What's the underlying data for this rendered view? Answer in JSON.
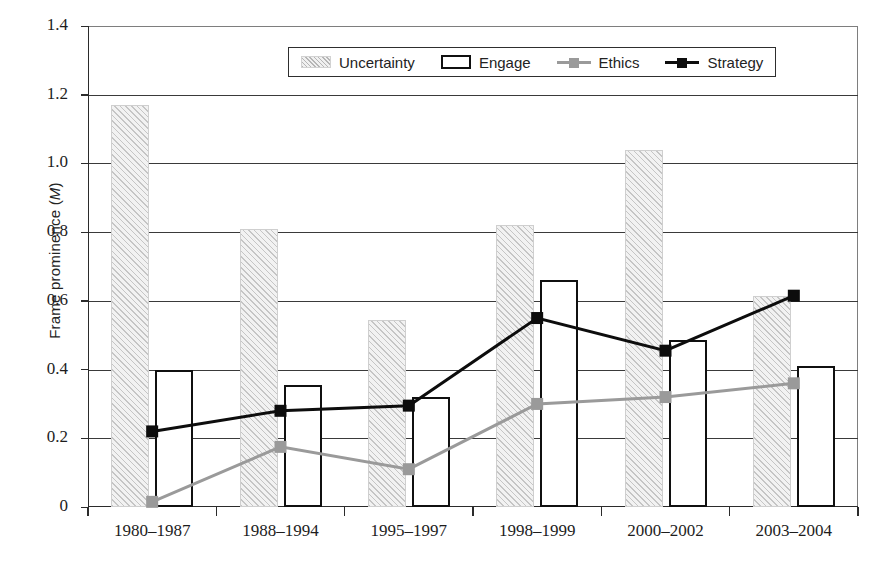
{
  "chart_data": {
    "type": "bar",
    "title": "",
    "subtitle": "",
    "xlabel": "",
    "ylabel": "Frame prominence (M)",
    "ylabel_plain": "Frame prominence (",
    "ylabel_italic": "M",
    "ylabel_tail": ")",
    "categories": [
      "1980–1987",
      "1988–1994",
      "1995–1997",
      "1998–1999",
      "2000–2002",
      "2003–2004"
    ],
    "ylim": [
      0,
      1.4
    ],
    "ytick_labels": [
      "0",
      "0.2",
      "0.4",
      "0.6",
      "0.8",
      "1.0",
      "1.2",
      "1.4"
    ],
    "ytick_values": [
      0,
      0.2,
      0.4,
      0.6,
      0.8,
      1.0,
      1.2,
      1.4
    ],
    "grid": true,
    "grid_axis": "y",
    "legend_position": "top-center",
    "series": [
      {
        "name": "Uncertainty",
        "render": "bar",
        "style": "hatched-gray",
        "color": "#f2f2f2",
        "values": [
          1.17,
          0.81,
          0.545,
          0.82,
          1.04,
          0.615
        ]
      },
      {
        "name": "Engage",
        "render": "bar",
        "style": "white-outline",
        "color": "#ffffff",
        "values": [
          0.4,
          0.355,
          0.32,
          0.66,
          0.485,
          0.41
        ]
      },
      {
        "name": "Ethics",
        "render": "line-square-marker",
        "color": "#9a9a9a",
        "values": [
          0.015,
          0.175,
          0.11,
          0.3,
          0.32,
          0.36
        ]
      },
      {
        "name": "Strategy",
        "render": "line-square-marker",
        "color": "#0d0d0d",
        "values": [
          0.22,
          0.28,
          0.295,
          0.55,
          0.455,
          0.615
        ]
      }
    ]
  },
  "legend": {
    "items": [
      {
        "label": "Uncertainty",
        "icon": "hatched-bar-swatch"
      },
      {
        "label": "Engage",
        "icon": "outlined-bar-swatch"
      },
      {
        "label": "Ethics",
        "icon": "gray-line-square-swatch"
      },
      {
        "label": "Strategy",
        "icon": "black-line-square-swatch"
      }
    ]
  },
  "colors": {
    "uncertainty_fill": "#f2f2f2",
    "uncertainty_hatch": "#a0a0a0",
    "engage_outline": "#101010",
    "ethics_line": "#9a9a9a",
    "strategy_line": "#0d0d0d",
    "axis": "#2b2b2b",
    "gridline": "#3a3a3a",
    "background": "#ffffff"
  }
}
